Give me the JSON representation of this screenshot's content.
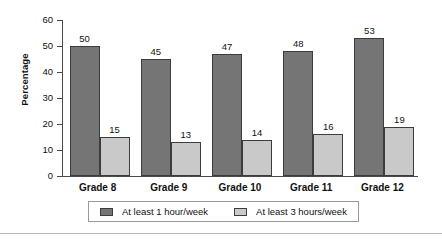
{
  "chart_data": {
    "type": "bar",
    "title": "",
    "xlabel": "",
    "ylabel": "Percentage",
    "ylim": [
      0,
      60
    ],
    "ytick_step": 10,
    "yticks": [
      0,
      10,
      20,
      30,
      40,
      50,
      60
    ],
    "grid": false,
    "legend_position": "bottom",
    "categories": [
      "Grade 8",
      "Grade 9",
      "Grade 10",
      "Grade 11",
      "Grade 12"
    ],
    "series": [
      {
        "name": "At least 1 hour/week",
        "color": "#757575",
        "values": [
          50,
          45,
          47,
          48,
          53
        ]
      },
      {
        "name": "At least 3 hours/week",
        "color": "#c9c9c9",
        "values": [
          15,
          13,
          14,
          16,
          19
        ]
      }
    ]
  },
  "colors": {
    "series_1": "#757575",
    "series_2": "#c9c9c9",
    "axis": "#4a4a4a",
    "bar_border": "#3c3c3c",
    "legend_border": "#9a9a9a",
    "footer_rule": "#b9b9b9",
    "background": "#ffffff"
  }
}
